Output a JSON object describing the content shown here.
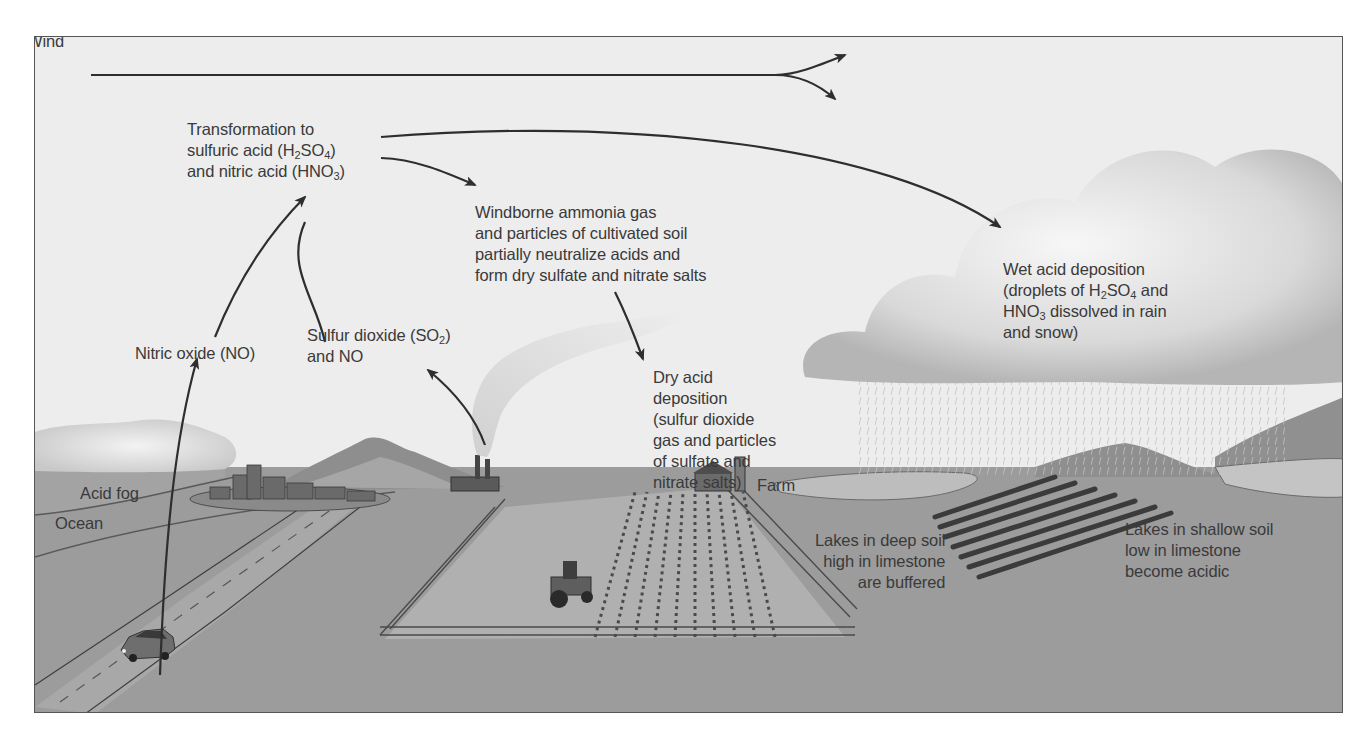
{
  "diagram": {
    "colors": {
      "sky": "#ededed",
      "ground": "#9c9c9c",
      "ocean": "#a4a4a4",
      "arrow": "#2e2e2e",
      "text": "#3a3a3a",
      "frame": "#555555"
    },
    "labels": {
      "wind": "Wind",
      "transformation": {
        "line1": "Transformation to",
        "line2_pre": "sulfuric acid (H",
        "line2_sub1": "2",
        "line2_mid": "SO",
        "line2_sub2": "4",
        "line2_post": ")",
        "line3_pre": "and nitric acid (HNO",
        "line3_sub": "3",
        "line3_post": ")"
      },
      "windborne": {
        "line1": "Windborne ammonia gas",
        "line2": "and particles of cultivated soil",
        "line3": "partially neutralize acids and",
        "line4": "form dry sulfate and nitrate salts"
      },
      "wet_deposition": {
        "line1": "Wet acid deposition",
        "line2_pre": "(droplets of H",
        "line2_sub1": "2",
        "line2_mid": "SO",
        "line2_sub2": "4",
        "line2_post": " and",
        "line3_pre": "HNO",
        "line3_sub": "3",
        "line3_post": " dissolved in rain",
        "line4": "and snow)"
      },
      "nitric_oxide": "Nitric oxide (NO)",
      "sulfur_dioxide": {
        "line1_pre": "Sulfur dioxide (SO",
        "line1_sub": "2",
        "line1_post": ")",
        "line2": "and NO"
      },
      "dry_deposition": {
        "line1": "Dry acid",
        "line2": "deposition",
        "line3": "(sulfur dioxide",
        "line4": "gas and particles",
        "line5": "of sulfate and",
        "line6": "nitrate salts)"
      },
      "farm": "Farm",
      "acid_fog": "Acid fog",
      "ocean": "Ocean",
      "lakes_deep": {
        "line1": "Lakes in deep soil",
        "line2": "high in limestone",
        "line3": "are buffered"
      },
      "lakes_shallow": {
        "line1": "Lakes in shallow soil",
        "line2": "low in limestone",
        "line3": "become acidic"
      }
    },
    "illustrations": [
      "wind-arrow-splitting",
      "cumulus-cloud-with-rain",
      "acid-fog-cloud",
      "city-buildings",
      "power-plant-smokestacks",
      "mountains",
      "car-on-road",
      "tractor-in-field",
      "crop-rows",
      "wooden-fence",
      "farm-barn-silo",
      "forest-rows",
      "lakes"
    ]
  }
}
